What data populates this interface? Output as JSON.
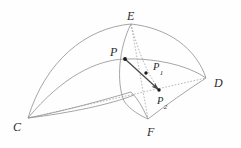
{
  "figure": {
    "type": "geometry-diagram",
    "canvas": {
      "width": 241,
      "height": 148
    },
    "background_color": "#fefefe",
    "stroke_color": "#8f8f8f",
    "accent_stroke_color": "#6d6d6d",
    "dot_color": "#1a1a1a",
    "label_color": "#2b2b2b",
    "labels": [
      {
        "id": "label-E",
        "text": "E",
        "x": 127,
        "y": 10,
        "subscript": ""
      },
      {
        "id": "label-D",
        "text": "D",
        "x": 214,
        "y": 77,
        "subscript": ""
      },
      {
        "id": "label-C",
        "text": "C",
        "x": 13,
        "y": 121,
        "subscript": ""
      },
      {
        "id": "label-F",
        "text": "F",
        "x": 147,
        "y": 126,
        "subscript": ""
      },
      {
        "id": "label-P",
        "text": "P",
        "x": 110,
        "y": 46,
        "subscript": ""
      },
      {
        "id": "label-P1",
        "text": "P",
        "x": 153,
        "y": 62,
        "subscript": "1"
      },
      {
        "id": "label-P2",
        "text": "P",
        "x": 157,
        "y": 96,
        "subscript": "2"
      }
    ],
    "points": [
      {
        "id": "point-E",
        "name": "E",
        "x": 131,
        "y": 24
      },
      {
        "id": "point-D",
        "name": "D",
        "x": 206,
        "y": 78
      },
      {
        "id": "point-C",
        "name": "C",
        "x": 28,
        "y": 118
      },
      {
        "id": "point-F",
        "name": "F",
        "x": 148,
        "y": 119
      },
      {
        "id": "point-P",
        "name": "P",
        "x": 125,
        "y": 59
      },
      {
        "id": "point-P1",
        "name": "P1",
        "x": 146,
        "y": 73
      },
      {
        "id": "point-P2",
        "name": "P2",
        "x": 159,
        "y": 90
      }
    ],
    "curves": {
      "edge_C_E_outer": "M28,118 C45,62 85,28 131,24",
      "edge_E_D_outer": "M131,24 C168,28 196,48 206,78",
      "edge_C_P_D_mid": "M28,118 C62,77 96,60 125,59 C152,58 186,64 206,78",
      "edge_C_F_lower": "M28,118 C60,112 104,100 131,92 C140,101 144,111 148,119",
      "edge_C_bottom": "M28,118 C70,113 112,104 134,95",
      "edge_F_D_lower": "M148,119 C166,105 186,91 206,78",
      "edge_E_P_F": "M131,24 C119,47 116,82 124,101 C130,110 141,116 148,119",
      "edge_E_F_dotted": "M131,24 L148,119",
      "edge_C_D_dotted": "M28,118 L206,78",
      "edge_E_P2_dotted": "M131,24 C138,52 148,74 159,90",
      "vector_P_to_P2": "M125,59 L159,90"
    },
    "vector": {
      "id": "vector-P-P2",
      "from": "P",
      "to": "P2",
      "has_arrowhead": true,
      "arrowhead_points_to": "P"
    }
  }
}
